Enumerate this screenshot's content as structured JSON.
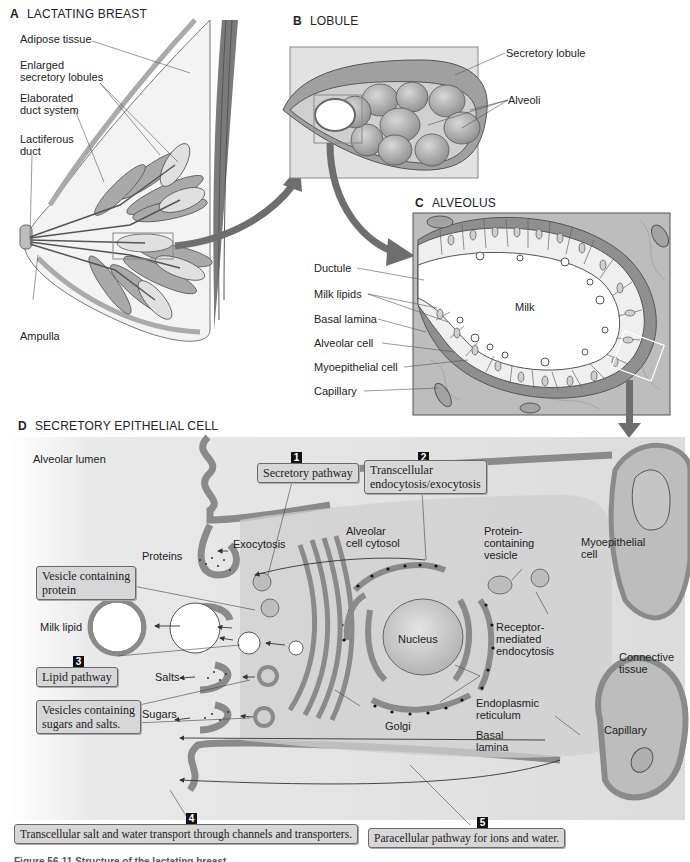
{
  "panels": {
    "a": {
      "letter": "A",
      "title": "LACTATING BREAST",
      "labels": {
        "adipose": "Adipose tissue",
        "lobules_1": "Enlarged",
        "lobules_2": "secretory lobules",
        "duct_1": "Elaborated",
        "duct_2": "duct system",
        "lactiferous_1": "Lactiferous",
        "lactiferous_2": "duct",
        "ampulla": "Ampulla"
      }
    },
    "b": {
      "letter": "B",
      "title": "LOBULE",
      "labels": {
        "secretory_lobule": "Secretory lobule",
        "alveoli": "Alveoli"
      }
    },
    "c": {
      "letter": "C",
      "title": "ALVEOLUS",
      "labels": {
        "ductule": "Ductule",
        "milk_lipids": "Milk lipids",
        "basal_lamina": "Basal lamina",
        "alveolar_cell": "Alveolar cell",
        "myoepithelial_cell": "Myoepithelial cell",
        "capillary": "Capillary",
        "milk": "Milk"
      }
    },
    "d": {
      "letter": "D",
      "title": "SECRETORY EPITHELIAL CELL",
      "labels": {
        "alveolar_lumen": "Alveolar lumen",
        "exocytosis": "Exocytosis",
        "proteins": "Proteins",
        "cytosol_1": "Alveolar",
        "cytosol_2": "cell cytosol",
        "protein_vesicle_1": "Protein-",
        "protein_vesicle_2": "containing",
        "protein_vesicle_3": "vesicle",
        "myoepithelial_1": "Myoepithelial",
        "myoepithelial_2": "cell",
        "milk_lipid": "Milk lipid",
        "nucleus": "Nucleus",
        "receptor_1": "Receptor-",
        "receptor_2": "mediated",
        "receptor_3": "endocytosis",
        "connective_1": "Connective",
        "connective_2": "tissue",
        "salts": "Salts",
        "sugars": "Sugars",
        "golgi": "Golgi",
        "er_1": "Endoplasmic",
        "er_2": "reticulum",
        "basal_1": "Basal",
        "basal_2": "lamina",
        "capillary": "Capillary"
      },
      "callouts": {
        "vesicle_protein_1": "Vesicle containing",
        "vesicle_protein_2": "protein",
        "vesicles_sugars_1": "Vesicles containing",
        "vesicles_sugars_2": "sugars and salts."
      },
      "pathways": [
        {
          "number": "1",
          "label": "Secretory pathway"
        },
        {
          "number": "2",
          "label_1": "Transcellular",
          "label_2": "endocytosis/exocytosis"
        },
        {
          "number": "3",
          "label": "Lipid pathway"
        },
        {
          "number": "4",
          "label": "Transcellular salt and water transport through channels and transporters."
        },
        {
          "number": "5",
          "label": "Paracellular pathway for ions and water."
        }
      ]
    }
  },
  "caption": "Figure 56-11  Structure of the lactating breast.",
  "colors": {
    "tissue_dark": "#8a8a8a",
    "tissue_mid": "#b5b5b5",
    "tissue_light": "#d8d8d8",
    "background_panel": "#e4e4e4",
    "arrow": "#6e6e6e"
  }
}
